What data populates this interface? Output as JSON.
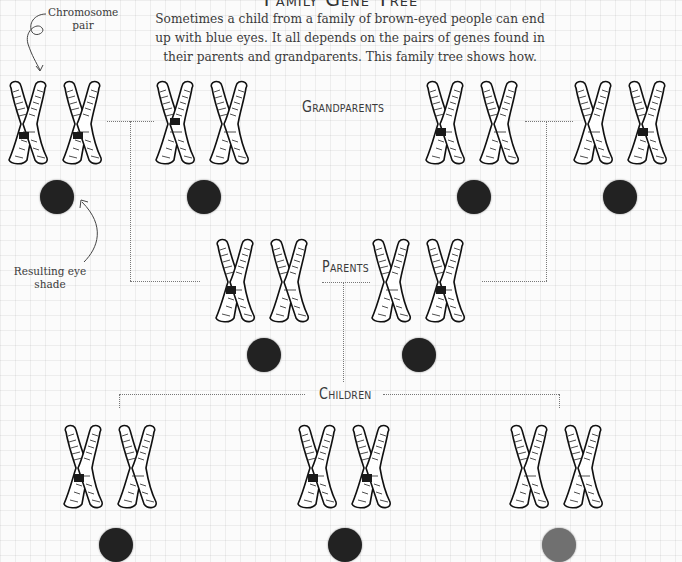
{
  "title": "Family Gene Tree",
  "intro": "Sometimes a child from a family of brown-eyed people can end up with blue eyes. It all depends on the pairs of genes found in their parents and grandparents. This family tree shows how.",
  "annotations": {
    "chromosome_pair": "Chromosome pair",
    "resulting_eye_shade": "Resulting eye shade"
  },
  "generations": {
    "grandparents": "Grandparents",
    "parents": "Parents",
    "children": "Children"
  },
  "colors": {
    "brown_eye": "#222222",
    "blue_eye": "#707070",
    "background": "#fbfbfb",
    "connector": "#777777"
  },
  "people": [
    {
      "generation": "grandparents",
      "position": 1,
      "band_chromosomes": [
        1,
        2
      ],
      "eye": "dark"
    },
    {
      "generation": "grandparents",
      "position": 2,
      "band_chromosomes": [
        1
      ],
      "eye": "dark"
    },
    {
      "generation": "grandparents",
      "position": 3,
      "band_chromosomes": [
        1
      ],
      "eye": "dark"
    },
    {
      "generation": "grandparents",
      "position": 4,
      "band_chromosomes": [
        3
      ],
      "eye": "dark"
    },
    {
      "generation": "parents",
      "position": 1,
      "band_chromosomes": [
        1
      ],
      "eye": "dark"
    },
    {
      "generation": "parents",
      "position": 2,
      "band_chromosomes": [
        3
      ],
      "eye": "dark"
    },
    {
      "generation": "children",
      "position": 1,
      "band_chromosomes": [
        1
      ],
      "eye": "dark"
    },
    {
      "generation": "children",
      "position": 2,
      "band_chromosomes": [
        1,
        3
      ],
      "eye": "dark"
    },
    {
      "generation": "children",
      "position": 3,
      "band_chromosomes": [],
      "eye": "light"
    }
  ]
}
